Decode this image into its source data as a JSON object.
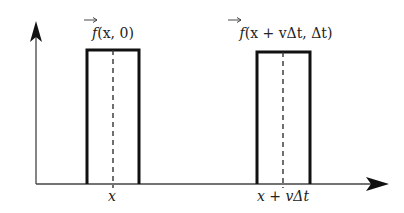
{
  "diagram": {
    "type": "pulse-translation",
    "colors": {
      "stroke": "#111111",
      "text": "#222222",
      "background": "#ffffff"
    },
    "axes": {
      "y_axis": {
        "label": ""
      },
      "x_axis": {
        "label": ""
      }
    },
    "pulses": [
      {
        "id": "initial",
        "label_f": "f",
        "label_args": "(x, 0)",
        "position_label": "x"
      },
      {
        "id": "translated",
        "label_f": "f",
        "label_args": "(x + vΔt, Δt)",
        "position_label": "x + vΔt"
      }
    ]
  }
}
